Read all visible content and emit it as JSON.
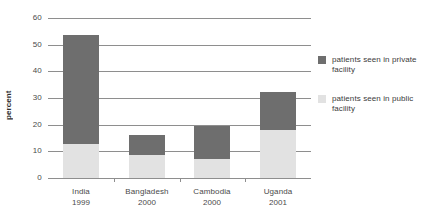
{
  "chart_data": {
    "type": "bar",
    "subtype": "stacked-bar",
    "title": "",
    "xlabel": "",
    "ylabel": "percent",
    "ylim": [
      0,
      60
    ],
    "yticks": [
      0,
      10,
      20,
      30,
      40,
      50,
      60
    ],
    "ytick_labels": [
      "0",
      "10",
      "20",
      "30",
      "40",
      "50",
      "60"
    ],
    "grid": true,
    "grid_axis": "y",
    "legend_position": "right",
    "categories": [
      "India 1999",
      "Bangladesh 2000",
      "Cambodia 2000",
      "Uganda 2001"
    ],
    "category_labels": [
      {
        "country": "India",
        "year": "1999"
      },
      {
        "country": "Bangladesh",
        "year": "2000"
      },
      {
        "country": "Cambodia",
        "year": "2000"
      },
      {
        "country": "Uganda",
        "year": "2001"
      }
    ],
    "series": [
      {
        "name": "patients seen in public facility",
        "color": "#e2e2e2",
        "values": [
          12.8,
          8.6,
          7.2,
          18.0
        ]
      },
      {
        "name": "patients seen in private facility",
        "color": "#6e6e6e",
        "values": [
          40.7,
          7.4,
          12.3,
          14.3
        ]
      }
    ],
    "totals": [
      53.5,
      16.0,
      19.5,
      32.3
    ]
  },
  "legend": {
    "items": [
      {
        "label": "patients seen in private facility",
        "color": "#6e6e6e"
      },
      {
        "label": "patients seen in public facility",
        "color": "#e2e2e2"
      }
    ]
  },
  "axis": {
    "y_title": "percent"
  },
  "colors": {
    "private": "#6e6e6e",
    "public": "#e2e2e2",
    "gridline": "#8e8e8e",
    "text": "#3b3b3b",
    "background": "#ffffff"
  }
}
